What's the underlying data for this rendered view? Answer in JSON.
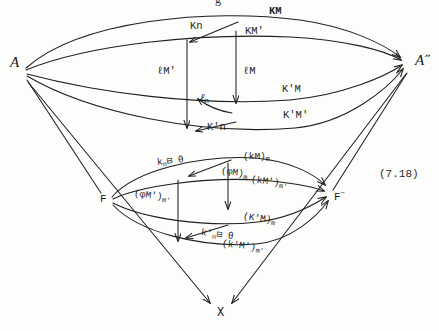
{
  "figure": {
    "equation_number": "(7.18)",
    "top_partial_glyph": "g"
  },
  "nodes": [
    {
      "id": "A",
      "label": "A",
      "x": 10,
      "y": 62
    },
    {
      "id": "Adbl",
      "label": "A˝",
      "x": 418,
      "y": 60
    },
    {
      "id": "F",
      "label": "F",
      "x": 101,
      "y": 194
    },
    {
      "id": "Fdbl",
      "label": "F˝",
      "x": 322,
      "y": 192
    },
    {
      "id": "X",
      "label": "X",
      "x": 216,
      "y": 306
    }
  ],
  "upper_labels": {
    "km": "KM",
    "kn": "Kn",
    "kmp": "KM'",
    "lmp": "ℓM'",
    "lm": "ℓM",
    "ln_base": "ℓ",
    "ln_sub": "n",
    "kpn": "K'n",
    "kpm": "K'M",
    "kpmp": "K'M'"
  },
  "lower_labels": {
    "kn_theta_base": "k",
    "kn_theta_sub": "n",
    "kn_theta_tail": "⊟ θ",
    "km_m_base": "(kM)",
    "km_m_sub": "m",
    "phim_m_base": "(φM)",
    "phim_m_sub": "m",
    "kmp_mp_base": "(kM')",
    "kmp_mp_sub": "m'",
    "phimp_mp_base": "(φM')",
    "phimp_mp_sub": "m'",
    "kpm_m_base": "(K'M)",
    "kpm_m_sub": "m",
    "kpn_theta_base": "k'",
    "kpn_theta_sub": "n",
    "kpn_theta_tail": "⊟ θ",
    "kpmp_mp_base": "(k'M')",
    "kpmp_mp_sub": "m'"
  },
  "style": {
    "ink": "#1f1f1f",
    "paper": "#fdfdfc",
    "stroke_width": 1.1
  }
}
